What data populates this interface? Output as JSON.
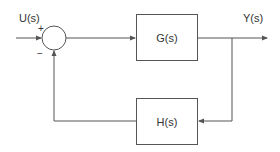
{
  "diagram": {
    "type": "feedback control block diagram",
    "input": {
      "label": "U(s)"
    },
    "output": {
      "label": "Y(s)"
    },
    "summing_junction": {
      "plus_sign": "+",
      "minus_sign": "−"
    },
    "forward_block": {
      "label": "G(s)"
    },
    "feedback_block": {
      "label": "H(s)"
    },
    "colors": {
      "line": "#555555",
      "text": "#333333",
      "background": "#ffffff"
    }
  }
}
